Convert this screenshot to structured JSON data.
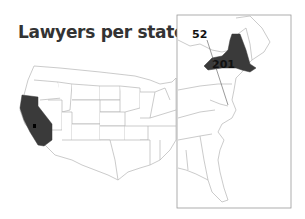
{
  "title": "Lawyers per state",
  "colors": {
    "highlight": "#3a3a3a",
    "state_border": "#b5b5b5",
    "state_fill": "#ffffff",
    "frame": "#999999",
    "text": "#111111"
  },
  "highlighted_states": [
    {
      "state": "California",
      "label": "",
      "map": "main"
    },
    {
      "state": "New York",
      "label": "201",
      "map": "inset"
    }
  ],
  "annotations": [
    {
      "label": "52",
      "region": "District of Columbia",
      "map": "inset",
      "leader_line": true
    },
    {
      "label": "201",
      "region": "New York",
      "map": "inset",
      "leader_line": false
    }
  ],
  "inset": {
    "description": "Enlarged view of U.S. East Coast"
  }
}
